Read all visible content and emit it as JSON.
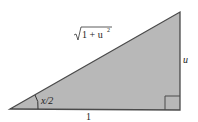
{
  "diagram": {
    "type": "right-triangle",
    "fill": "#b8b8b8",
    "stroke": "#4a4a4a",
    "labels": {
      "hypotenuse_radical": "1 + u",
      "hypotenuse_exponent": "2",
      "opposite": "u",
      "adjacent": "1",
      "angle": "x/2"
    }
  }
}
